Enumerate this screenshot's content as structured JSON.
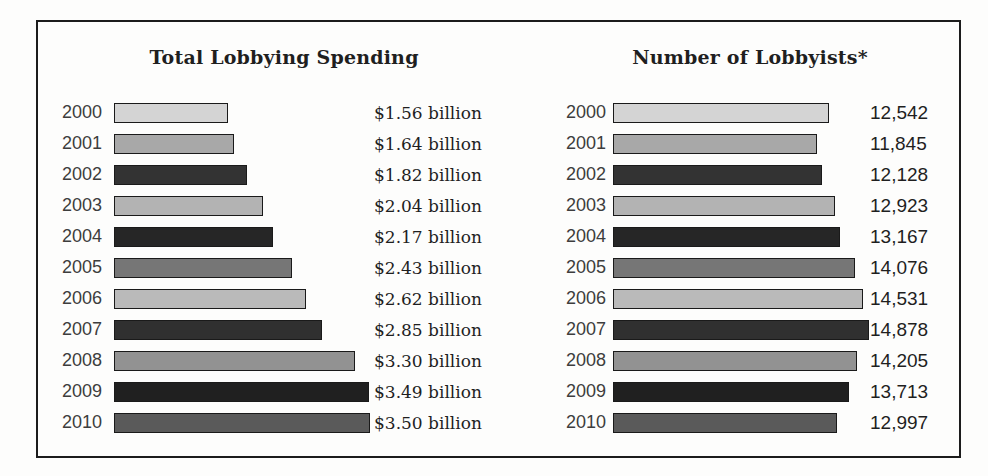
{
  "page": {
    "background": "#fdfdfc"
  },
  "frame": {
    "border_color": "#1c1c1c"
  },
  "chart_data": [
    {
      "type": "bar",
      "orientation": "horizontal",
      "title": "Total Lobbying Spending",
      "categories": [
        "2000",
        "2001",
        "2002",
        "2003",
        "2004",
        "2005",
        "2006",
        "2007",
        "2008",
        "2009",
        "2010"
      ],
      "values": [
        1.56,
        1.64,
        1.82,
        2.04,
        2.17,
        2.43,
        2.62,
        2.85,
        3.3,
        3.49,
        3.5
      ],
      "value_labels": [
        "$1.56 billion",
        "$1.64 billion",
        "$1.82 billion",
        "$2.04 billion",
        "$2.17 billion",
        "$2.43 billion",
        "$2.62 billion",
        "$2.85 billion",
        "$3.30 billion",
        "$3.49 billion",
        "$3.50 billion"
      ],
      "xlabel": "",
      "ylabel": "",
      "xlim": [
        0,
        3.5
      ],
      "grid": false,
      "legend": "none"
    },
    {
      "type": "bar",
      "orientation": "horizontal",
      "title": "Number of Lobbyists*",
      "categories": [
        "2000",
        "2001",
        "2002",
        "2003",
        "2004",
        "2005",
        "2006",
        "2007",
        "2008",
        "2009",
        "2010"
      ],
      "values": [
        12542,
        11845,
        12128,
        12923,
        13167,
        14076,
        14531,
        14878,
        14205,
        13713,
        12997
      ],
      "value_labels": [
        "12,542",
        "11,845",
        "12,128",
        "12,923",
        "13,167",
        "14,076",
        "14,531",
        "14,878",
        "14,205",
        "13,713",
        "12,997"
      ],
      "xlabel": "",
      "ylabel": "",
      "xlim": [
        0,
        14878
      ],
      "grid": false,
      "legend": "none"
    }
  ],
  "style": {
    "bar_colors": [
      "#d4d4d4",
      "#a8a8a8",
      "#333333",
      "#b3b3b3",
      "#262626",
      "#767676",
      "#bababa",
      "#303030",
      "#929292",
      "#202020",
      "#5a5a5a"
    ],
    "bar_border_color": "#1a1a1a",
    "title_color": "#1f1f1f",
    "year_label_color": "#3d3d3d",
    "value_label_color": "#1f1f1f",
    "max_bar_px": 256
  }
}
